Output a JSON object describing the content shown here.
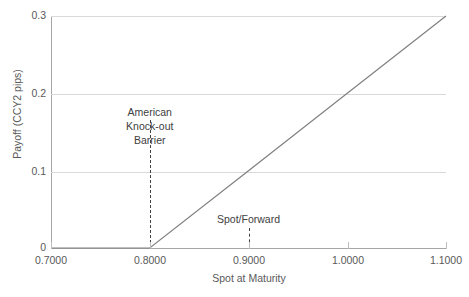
{
  "chart_data": {
    "type": "line",
    "title": "",
    "xlabel": "Spot at Maturity",
    "ylabel": "Payoff (CCY2 pips)",
    "xlim": [
      0.7,
      1.1
    ],
    "ylim": [
      0,
      0.3
    ],
    "x_ticks": [
      "0.7000",
      "0.8000",
      "0.9000",
      "1.0000",
      "1.1000"
    ],
    "x_tick_values": [
      0.7,
      0.8,
      0.9,
      1.0,
      1.1
    ],
    "y_ticks": [
      "0",
      "0.1",
      "0.2",
      "0.3"
    ],
    "y_tick_values": [
      0,
      0.1,
      0.2,
      0.3
    ],
    "grid": "horizontal",
    "legend": "none",
    "series": [
      {
        "name": "Payoff",
        "color": "#808080",
        "x": [
          0.7,
          0.75,
          0.8,
          0.9,
          1.0,
          1.1
        ],
        "values": [
          0,
          0,
          0,
          0.1,
          0.2,
          0.3
        ]
      }
    ],
    "annotations": [
      {
        "id": "american-knock-out-barrier",
        "label_lines": [
          "American",
          "Knock-out",
          "Barrier"
        ],
        "x": 0.8,
        "line_from_y": 0.0,
        "line_to_y": 0.128,
        "style": "dashed-vertical"
      },
      {
        "id": "spot-forward",
        "label_lines": [
          "Spot/Forward"
        ],
        "x": 0.9,
        "line_from_y": 0.0,
        "line_to_y": 0.026,
        "style": "dashed-vertical"
      }
    ]
  },
  "colors": {
    "series_line": "#808080",
    "gridline": "#d9d9d9",
    "axis": "#a6a6a6",
    "tick_text": "#595959",
    "annotation_text": "#404040",
    "background": "#ffffff"
  },
  "axes": {
    "y_title": "Payoff (CCY2 pips)",
    "x_title": "Spot at Maturity"
  },
  "y_labels": {
    "t0": "0",
    "t1": "0.1",
    "t2": "0.2",
    "t3": "0.3"
  },
  "x_labels": {
    "t0": "0.7000",
    "t1": "0.8000",
    "t2": "0.9000",
    "t3": "1.0000",
    "t4": "1.1000"
  },
  "annotations": {
    "barrier": {
      "line1": "American",
      "line2": "Knock-out",
      "line3": "Barrier"
    },
    "spot": {
      "line1": "Spot/Forward"
    }
  }
}
